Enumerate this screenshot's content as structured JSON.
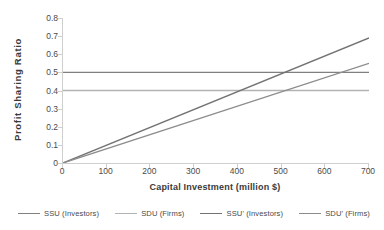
{
  "chart_data": {
    "type": "line",
    "title": "",
    "xlabel": "Capital Investment (million $)",
    "ylabel": "Profit Sharing Ratio",
    "xlim": [
      0,
      700
    ],
    "ylim": [
      0,
      0.8
    ],
    "grid": false,
    "legend_position": "bottom",
    "xticks": [
      "0",
      "100",
      "200",
      "300",
      "400",
      "500",
      "600",
      "700"
    ],
    "xtick_values": [
      0,
      100,
      200,
      300,
      400,
      500,
      600,
      700
    ],
    "yticks": [
      "0",
      "0.1",
      "0.2",
      "0.3",
      "0.4",
      "0.5",
      "0.6",
      "0.7",
      "0.8"
    ],
    "ytick_values": [
      0,
      0.1,
      0.2,
      0.3,
      0.4,
      0.5,
      0.6,
      0.7,
      0.8
    ],
    "x": [
      0,
      700
    ],
    "series": [
      {
        "name": "SSU (Investors)",
        "color": "#808080",
        "width": 1.3,
        "values": [
          0.5,
          0.5
        ]
      },
      {
        "name": "SDU (Firms)",
        "color": "#b3b3b3",
        "width": 1.3,
        "values": [
          0.4,
          0.4
        ]
      },
      {
        "name": "SSU' (Investors)",
        "color": "#737373",
        "width": 1.4,
        "values": [
          0.0,
          0.69
        ]
      },
      {
        "name": "SDU' (Firms)",
        "color": "#8c8c8c",
        "width": 1.3,
        "values": [
          0.0,
          0.55
        ]
      }
    ]
  },
  "legend": {
    "items": [
      {
        "label": "SSU (Investors)",
        "color": "#808080"
      },
      {
        "label": "SDU (Firms)",
        "color": "#b3b3b3"
      },
      {
        "label": "SSU' (Investors)",
        "color": "#737373"
      },
      {
        "label": "SDU' (Firms)",
        "color": "#8c8c8c"
      }
    ]
  },
  "axes": {
    "line_color": "#cfcfcf"
  }
}
